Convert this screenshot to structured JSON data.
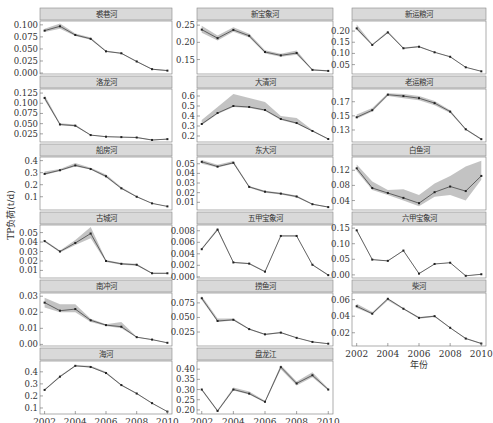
{
  "figure": {
    "ylabel": "TP负荷(t/d)",
    "xlabel": "年份",
    "x_ticks": [
      2002,
      2004,
      2006,
      2008,
      2010
    ],
    "colors": {
      "line": "#333333",
      "band": "#bdbdbd",
      "header_bg": "#d9d9d9",
      "axis": "#555555",
      "text": "#333333"
    }
  },
  "chart_data": [
    {
      "type": "line",
      "title": "裘巷河",
      "col": 0,
      "row": 0,
      "x": [
        2002,
        2003,
        2004,
        2005,
        2006,
        2007,
        2008,
        2009,
        2010
      ],
      "values": [
        0.088,
        0.097,
        0.079,
        0.071,
        0.045,
        0.041,
        0.024,
        0.008,
        0.005
      ],
      "lower": [
        0.085,
        0.092,
        0.077,
        0.069,
        0.044,
        0.04,
        0.023,
        0.007,
        0.004
      ],
      "upper": [
        0.092,
        0.103,
        0.082,
        0.074,
        0.047,
        0.042,
        0.025,
        0.009,
        0.006
      ],
      "yticks": [
        0.0,
        0.025,
        0.05,
        0.075,
        0.1
      ],
      "ytick_labels": [
        "0.000",
        "0.025",
        "0.050",
        "0.075",
        "0.100"
      ],
      "ylim": [
        -0.002,
        0.108
      ]
    },
    {
      "type": "line",
      "title": "新宝象河",
      "col": 1,
      "row": 0,
      "x": [
        2002,
        2003,
        2004,
        2005,
        2006,
        2007,
        2008,
        2009,
        2010
      ],
      "values": [
        0.237,
        0.212,
        0.236,
        0.219,
        0.172,
        0.162,
        0.169,
        0.12,
        0.117
      ],
      "lower": [
        0.228,
        0.205,
        0.231,
        0.214,
        0.168,
        0.158,
        0.164,
        0.118,
        0.115
      ],
      "upper": [
        0.248,
        0.22,
        0.244,
        0.225,
        0.177,
        0.167,
        0.176,
        0.122,
        0.119
      ],
      "yticks": [
        0.15,
        0.2,
        0.25
      ],
      "ytick_labels": [
        "0.15",
        "0.20",
        "0.25"
      ],
      "ylim": [
        0.108,
        0.262
      ]
    },
    {
      "type": "line",
      "title": "新运粮河",
      "col": 2,
      "row": 0,
      "x": [
        2002,
        2003,
        2004,
        2005,
        2006,
        2007,
        2008,
        2009,
        2010
      ],
      "values": [
        0.212,
        0.138,
        0.194,
        0.123,
        0.13,
        0.105,
        0.085,
        0.038,
        0.02
      ],
      "lower": [
        0.205,
        0.135,
        0.19,
        0.121,
        0.128,
        0.104,
        0.084,
        0.037,
        0.019
      ],
      "upper": [
        0.23,
        0.142,
        0.2,
        0.126,
        0.133,
        0.107,
        0.087,
        0.039,
        0.021
      ],
      "yticks": [
        0.05,
        0.1,
        0.15,
        0.2
      ],
      "ytick_labels": [
        "0.05",
        "0.10",
        "0.15",
        "0.20"
      ],
      "ylim": [
        0.008,
        0.245
      ]
    },
    {
      "type": "line",
      "title": "洛龙河",
      "col": 0,
      "row": 1,
      "x": [
        2002,
        2003,
        2004,
        2005,
        2006,
        2007,
        2008,
        2009,
        2010
      ],
      "values": [
        0.113,
        0.048,
        0.045,
        0.022,
        0.018,
        0.017,
        0.016,
        0.01,
        0.012
      ],
      "lower": [
        0.108,
        0.046,
        0.043,
        0.021,
        0.017,
        0.016,
        0.015,
        0.009,
        0.011
      ],
      "upper": [
        0.12,
        0.051,
        0.048,
        0.023,
        0.019,
        0.018,
        0.017,
        0.011,
        0.013
      ],
      "yticks": [
        0.025,
        0.05,
        0.075,
        0.1,
        0.125
      ],
      "ytick_labels": [
        "0.025",
        "0.050",
        "0.075",
        "0.100",
        "0.125"
      ],
      "ylim": [
        0.005,
        0.135
      ]
    },
    {
      "type": "line",
      "title": "大清河",
      "col": 1,
      "row": 1,
      "x": [
        2002,
        2003,
        2004,
        2005,
        2006,
        2007,
        2008,
        2009,
        2010
      ],
      "values": [
        0.32,
        0.43,
        0.5,
        0.49,
        0.46,
        0.37,
        0.33,
        0.25,
        0.17
      ],
      "lower": [
        0.31,
        0.42,
        0.49,
        0.48,
        0.45,
        0.36,
        0.32,
        0.245,
        0.165
      ],
      "upper": [
        0.36,
        0.49,
        0.62,
        0.58,
        0.54,
        0.4,
        0.38,
        0.26,
        0.175
      ],
      "yticks": [
        0.2,
        0.3,
        0.4,
        0.5,
        0.6
      ],
      "ytick_labels": [
        "0.2",
        "0.3",
        "0.4",
        "0.5",
        "0.6"
      ],
      "ylim": [
        0.14,
        0.67
      ]
    },
    {
      "type": "line",
      "title": "老运粮河",
      "col": 2,
      "row": 1,
      "x": [
        2002,
        2003,
        2004,
        2005,
        2006,
        2007,
        2008,
        2009,
        2010
      ],
      "values": [
        0.148,
        0.158,
        0.18,
        0.178,
        0.175,
        0.168,
        0.156,
        0.131,
        0.117
      ],
      "lower": [
        0.146,
        0.156,
        0.178,
        0.175,
        0.172,
        0.165,
        0.154,
        0.13,
        0.116
      ],
      "upper": [
        0.152,
        0.161,
        0.182,
        0.181,
        0.178,
        0.171,
        0.158,
        0.132,
        0.118
      ],
      "yticks": [
        0.13,
        0.15,
        0.17
      ],
      "ytick_labels": [
        "0.13",
        "0.15",
        "0.17"
      ],
      "ylim": [
        0.113,
        0.188
      ]
    },
    {
      "type": "line",
      "title": "船房河",
      "col": 0,
      "row": 2,
      "x": [
        2002,
        2003,
        2004,
        2005,
        2006,
        2007,
        2008,
        2009,
        2010
      ],
      "values": [
        0.29,
        0.32,
        0.36,
        0.33,
        0.27,
        0.17,
        0.1,
        0.045,
        0.02
      ],
      "lower": [
        0.28,
        0.315,
        0.35,
        0.325,
        0.26,
        0.165,
        0.098,
        0.044,
        0.019
      ],
      "upper": [
        0.31,
        0.33,
        0.38,
        0.34,
        0.285,
        0.18,
        0.105,
        0.047,
        0.021
      ],
      "yticks": [
        0.1,
        0.2,
        0.3,
        0.4
      ],
      "ytick_labels": [
        "0.1",
        "0.2",
        "0.3",
        "0.4"
      ],
      "ylim": [
        -0.01,
        0.43
      ]
    },
    {
      "type": "line",
      "title": "东大河",
      "col": 1,
      "row": 2,
      "x": [
        2002,
        2003,
        2004,
        2005,
        2006,
        2007,
        2008,
        2009,
        2010
      ],
      "values": [
        0.052,
        0.047,
        0.051,
        0.026,
        0.021,
        0.019,
        0.016,
        0.008,
        0.005
      ],
      "lower": [
        0.05,
        0.046,
        0.05,
        0.025,
        0.02,
        0.018,
        0.015,
        0.0075,
        0.0045
      ],
      "upper": [
        0.054,
        0.049,
        0.053,
        0.027,
        0.022,
        0.02,
        0.017,
        0.0085,
        0.0055
      ],
      "yticks": [
        0.01,
        0.02,
        0.03,
        0.04,
        0.05
      ],
      "ytick_labels": [
        "0.01",
        "0.02",
        "0.03",
        "0.04",
        "0.05"
      ],
      "ylim": [
        0.002,
        0.057
      ]
    },
    {
      "type": "line",
      "title": "白鱼河",
      "col": 2,
      "row": 2,
      "x": [
        2002,
        2003,
        2004,
        2005,
        2006,
        2007,
        2008,
        2009,
        2010
      ],
      "values": [
        0.125,
        0.073,
        0.06,
        0.047,
        0.033,
        0.062,
        0.077,
        0.065,
        0.105
      ],
      "lower": [
        0.118,
        0.068,
        0.055,
        0.04,
        0.025,
        0.05,
        0.055,
        0.04,
        0.095
      ],
      "upper": [
        0.135,
        0.09,
        0.068,
        0.07,
        0.055,
        0.085,
        0.105,
        0.13,
        0.145
      ],
      "yticks": [
        0.04,
        0.08,
        0.12
      ],
      "ytick_labels": [
        "0.04",
        "0.08",
        "0.12"
      ],
      "ylim": [
        0.015,
        0.155
      ]
    },
    {
      "type": "line",
      "title": "古城河",
      "col": 0,
      "row": 3,
      "x": [
        2002,
        2003,
        2004,
        2005,
        2006,
        2007,
        2008,
        2009,
        2010
      ],
      "values": [
        0.041,
        0.03,
        0.039,
        0.049,
        0.02,
        0.017,
        0.016,
        0.007,
        0.007
      ],
      "lower": [
        0.04,
        0.029,
        0.037,
        0.044,
        0.019,
        0.016,
        0.015,
        0.0065,
        0.0065
      ],
      "upper": [
        0.042,
        0.031,
        0.042,
        0.056,
        0.021,
        0.018,
        0.017,
        0.0075,
        0.0075
      ],
      "yticks": [
        0.01,
        0.02,
        0.03,
        0.04,
        0.05
      ],
      "ytick_labels": [
        "0.01",
        "0.02",
        "0.03",
        "0.04",
        "0.05"
      ],
      "ylim": [
        0.002,
        0.058
      ]
    },
    {
      "type": "line",
      "title": "五甲宝象河",
      "col": 1,
      "row": 3,
      "x": [
        2002,
        2003,
        2004,
        2005,
        2006,
        2007,
        2008,
        2009,
        2010
      ],
      "values": [
        0.0048,
        0.0082,
        0.0025,
        0.0023,
        0.0009,
        0.0071,
        0.0071,
        0.0021,
        0.0003
      ],
      "lower": [
        0.0047,
        0.008,
        0.0024,
        0.0022,
        0.0008,
        0.007,
        0.007,
        0.002,
        0.0002
      ],
      "upper": [
        0.005,
        0.0085,
        0.0026,
        0.0024,
        0.001,
        0.0072,
        0.0072,
        0.0022,
        0.0004
      ],
      "yticks": [
        0.0,
        0.002,
        0.004,
        0.006,
        0.008
      ],
      "ytick_labels": [
        "0.000",
        "0.002",
        "0.004",
        "0.006",
        "0.008"
      ],
      "ylim": [
        -0.0002,
        0.009
      ]
    },
    {
      "type": "line",
      "title": "六甲宝象河",
      "col": 2,
      "row": 3,
      "x": [
        2002,
        2003,
        2004,
        2005,
        2006,
        2007,
        2008,
        2009,
        2010
      ],
      "values": [
        0.143,
        0.049,
        0.045,
        0.078,
        0.004,
        0.035,
        0.039,
        -0.003,
        0.002
      ],
      "lower": [
        0.14,
        0.048,
        0.044,
        0.077,
        0.003,
        0.034,
        0.038,
        -0.004,
        0.001
      ],
      "upper": [
        0.146,
        0.05,
        0.046,
        0.079,
        0.005,
        0.036,
        0.04,
        -0.002,
        0.003
      ],
      "yticks": [
        0.0,
        0.05,
        0.1,
        0.15
      ],
      "ytick_labels": [
        "0.00",
        "0.05",
        "0.10",
        "0.15"
      ],
      "ylim": [
        -0.01,
        0.16
      ]
    },
    {
      "type": "line",
      "title": "南冲河",
      "col": 0,
      "row": 4,
      "x": [
        2002,
        2003,
        2004,
        2005,
        2006,
        2007,
        2008,
        2009,
        2010
      ],
      "values": [
        0.026,
        0.021,
        0.022,
        0.015,
        0.012,
        0.011,
        0.0045,
        0.003,
        0.001
      ],
      "lower": [
        0.023,
        0.02,
        0.02,
        0.014,
        0.0115,
        0.01,
        0.0043,
        0.0028,
        0.0009
      ],
      "upper": [
        0.029,
        0.025,
        0.025,
        0.016,
        0.0125,
        0.014,
        0.0047,
        0.0032,
        0.0011
      ],
      "yticks": [
        0.0,
        0.01,
        0.02,
        0.03
      ],
      "ytick_labels": [
        "0.00",
        "0.01",
        "0.02",
        "0.03"
      ],
      "ylim": [
        -0.001,
        0.032
      ]
    },
    {
      "type": "line",
      "title": "捞鱼河",
      "col": 1,
      "row": 4,
      "x": [
        2002,
        2003,
        2004,
        2005,
        2006,
        2007,
        2008,
        2009,
        2010
      ],
      "values": [
        0.083,
        0.044,
        0.046,
        0.03,
        0.021,
        0.024,
        0.015,
        0.008,
        0.005
      ],
      "lower": [
        0.08,
        0.042,
        0.045,
        0.029,
        0.02,
        0.023,
        0.0145,
        0.0075,
        0.0045
      ],
      "upper": [
        0.087,
        0.048,
        0.048,
        0.031,
        0.022,
        0.025,
        0.0155,
        0.0085,
        0.0055
      ],
      "yticks": [
        0.025,
        0.05,
        0.075
      ],
      "ytick_labels": [
        "0.025",
        "0.050",
        "0.075"
      ],
      "ylim": [
        0.001,
        0.092
      ]
    },
    {
      "type": "line",
      "title": "柴河",
      "col": 2,
      "row": 4,
      "x": [
        2002,
        2003,
        2004,
        2005,
        2006,
        2007,
        2008,
        2009,
        2010
      ],
      "values": [
        0.052,
        0.043,
        0.061,
        0.049,
        0.038,
        0.04,
        0.026,
        0.013,
        0.007
      ],
      "lower": [
        0.05,
        0.042,
        0.059,
        0.048,
        0.037,
        0.039,
        0.0255,
        0.0125,
        0.0065
      ],
      "upper": [
        0.055,
        0.045,
        0.062,
        0.05,
        0.039,
        0.041,
        0.0265,
        0.0135,
        0.0075
      ],
      "yticks": [
        0.02,
        0.04,
        0.06
      ],
      "ytick_labels": [
        "0.02",
        "0.04",
        "0.06"
      ],
      "ylim": [
        0.004,
        0.068
      ]
    },
    {
      "type": "line",
      "title": "海河",
      "col": 0,
      "row": 5,
      "x": [
        2002,
        2003,
        2004,
        2005,
        2006,
        2007,
        2008,
        2009,
        2010
      ],
      "values": [
        0.25,
        0.36,
        0.45,
        0.44,
        0.39,
        0.29,
        0.22,
        0.14,
        0.07
      ],
      "lower": [
        0.245,
        0.355,
        0.445,
        0.435,
        0.385,
        0.285,
        0.215,
        0.137,
        0.068
      ],
      "upper": [
        0.255,
        0.37,
        0.455,
        0.45,
        0.4,
        0.295,
        0.225,
        0.143,
        0.072
      ],
      "yticks": [
        0.1,
        0.2,
        0.3,
        0.4
      ],
      "ytick_labels": [
        "0.1",
        "0.2",
        "0.3",
        "0.4"
      ],
      "ylim": [
        0.05,
        0.49
      ]
    },
    {
      "type": "line",
      "title": "盘龙江",
      "col": 1,
      "row": 5,
      "x": [
        2002,
        2003,
        2004,
        2005,
        2006,
        2007,
        2008,
        2009,
        2010
      ],
      "values": [
        0.3,
        0.195,
        0.3,
        0.28,
        0.24,
        0.41,
        0.33,
        0.37,
        0.3
      ],
      "lower": [
        0.295,
        0.19,
        0.295,
        0.275,
        0.235,
        0.4,
        0.32,
        0.36,
        0.295
      ],
      "upper": [
        0.305,
        0.2,
        0.31,
        0.29,
        0.245,
        0.42,
        0.34,
        0.385,
        0.305
      ],
      "yticks": [
        0.2,
        0.25,
        0.3,
        0.35,
        0.4
      ],
      "ytick_labels": [
        "0.20",
        "0.25",
        "0.30",
        "0.35",
        "0.40"
      ],
      "ylim": [
        0.18,
        0.44
      ]
    }
  ]
}
